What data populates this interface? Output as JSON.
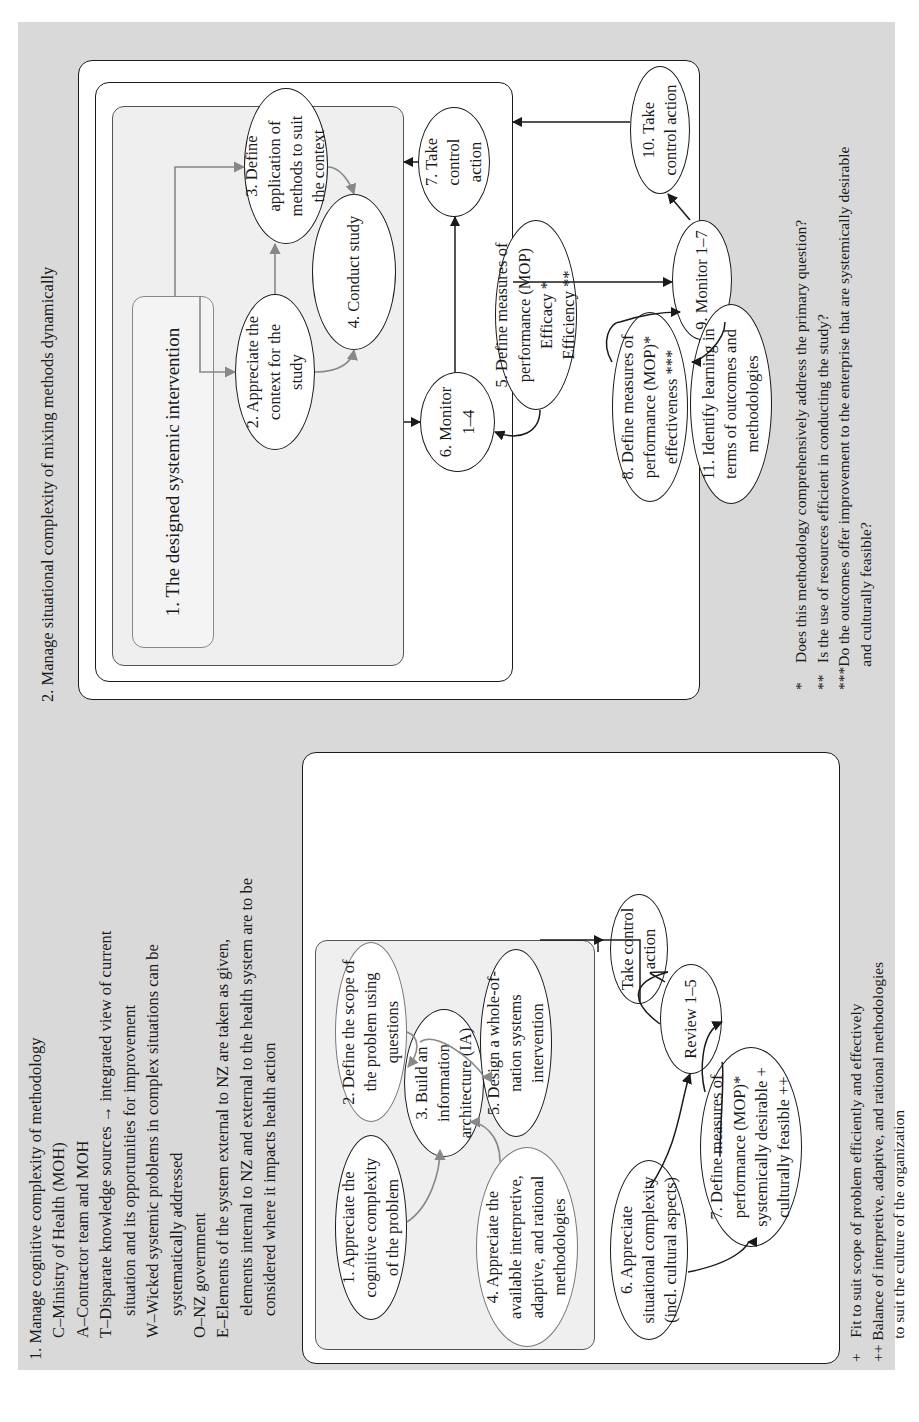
{
  "section1": {
    "heading": "1. Manage cognitive complexity of methodology",
    "catwoe": [
      {
        "text": "C–Ministry of Health (MOH)",
        "indent": 1
      },
      {
        "text": "A–Contractor team and MOH",
        "indent": 1
      },
      {
        "text": "T–Disparate knowledge sources → integrated view of current",
        "indent": 1
      },
      {
        "text": "situation and its opportunities for improvement",
        "indent": 2
      },
      {
        "text": "W–Wicked systemic problems in complex situations can be",
        "indent": 1
      },
      {
        "text": "systematically addressed",
        "indent": 2
      },
      {
        "text": "O–NZ government",
        "indent": 1
      },
      {
        "text": "E–Elements of the system external to NZ are taken as given,",
        "indent": 1
      },
      {
        "text": "elements internal to NZ and external to the health system are to be",
        "indent": 2
      },
      {
        "text": "considered where it impacts health action",
        "indent": 2
      }
    ],
    "nodes": {
      "n1": "1. Appreciate the\ncognitive complexity\nof the problem",
      "n2": "2. Define the scope of\nthe problem using\nquestions",
      "n3": "3. Build an\ninformation\narchitecture (IA)",
      "n4": "4. Appreciate the\navailable interpretive,\nadaptive, and rational\nmethodologies",
      "n5": "5. Design a whole-of-\nnation systems\nintervention",
      "n6": "6. Appreciate\nsituational complexity\n(incl. cultural aspects)",
      "n7": "7. Define measures of\nperformance (MOP)*\nsystemically desirable +\nculturally feasible ++",
      "review": "Review 1–5",
      "control": "Take control\naction"
    },
    "footnotes": [
      "+    Fit to suit scope of problem efficiently and effectively",
      "++ Balance of interpretive, adaptive, and rational methodologies",
      "      to suit the culture of the organization"
    ]
  },
  "section2": {
    "heading": "2. Manage situational complexity of mixing methods dynamically",
    "nodes": {
      "n1": "1. The designed systemic intervention",
      "n2": "2. Appreciate the\ncontext for the\nstudy",
      "n3": "3. Define\napplication of\nmethods to suit\nthe context",
      "n4": "4. Conduct study",
      "n5": "5. Define measures of\nperformance (MOP)\nEfficacy *\nEfficiency **",
      "n6": "6. Monitor\n1–4",
      "n7": "7. Take\ncontrol\naction",
      "n8": "8. Define measures of\nperformance (MOP)*\neffectiveness ***",
      "n9": "9. Monitor 1–7",
      "n10": "10. Take\ncontrol action",
      "n11": "11. Identify learning in\nterms of outcomes and\nmethodologies"
    },
    "footnotes": [
      "*     Does this methodology comprehensively address the primary question?",
      "**   Is the use of resources efficient in conducting the study?",
      "***Do the outcomes offer improvement to the enterprise that are systemically desirable",
      "      and culturally feasible?"
    ]
  },
  "colors": {
    "background": "#d9d9d9",
    "box_fill": "#ffffff",
    "inner_fill": "#efefef",
    "stroke": "#1a1a1a",
    "grey_arrow": "#888888"
  }
}
